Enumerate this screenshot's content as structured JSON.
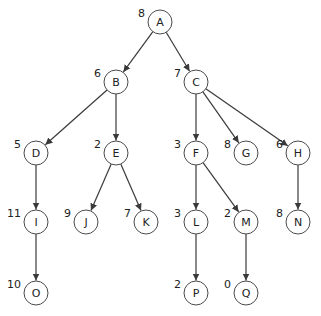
{
  "diagram": {
    "type": "tree",
    "node_radius": 12,
    "colors": {
      "line": "#3a3a3a",
      "node_stroke": "#4a4a4a",
      "text": "#222222",
      "background": "#ffffff"
    },
    "nodes": [
      {
        "id": "A",
        "label": "A",
        "value": "8",
        "x": 160,
        "y": 22
      },
      {
        "id": "B",
        "label": "B",
        "value": "6",
        "x": 116,
        "y": 82
      },
      {
        "id": "C",
        "label": "C",
        "value": "7",
        "x": 196,
        "y": 82
      },
      {
        "id": "D",
        "label": "D",
        "value": "5",
        "x": 36,
        "y": 153
      },
      {
        "id": "E",
        "label": "E",
        "value": "2",
        "x": 116,
        "y": 153
      },
      {
        "id": "F",
        "label": "F",
        "value": "3",
        "x": 196,
        "y": 153
      },
      {
        "id": "G",
        "label": "G",
        "value": "8",
        "x": 246,
        "y": 153
      },
      {
        "id": "H",
        "label": "H",
        "value": "6",
        "x": 298,
        "y": 153
      },
      {
        "id": "I",
        "label": "I",
        "value": "11",
        "x": 36,
        "y": 222
      },
      {
        "id": "J",
        "label": "J",
        "value": "9",
        "x": 86,
        "y": 222
      },
      {
        "id": "K",
        "label": "K",
        "value": "7",
        "x": 146,
        "y": 222
      },
      {
        "id": "L",
        "label": "L",
        "value": "3",
        "x": 196,
        "y": 222
      },
      {
        "id": "M",
        "label": "M",
        "value": "2",
        "x": 246,
        "y": 222
      },
      {
        "id": "N",
        "label": "N",
        "value": "8",
        "x": 298,
        "y": 222
      },
      {
        "id": "O",
        "label": "O",
        "value": "10",
        "x": 36,
        "y": 293
      },
      {
        "id": "P",
        "label": "P",
        "value": "2",
        "x": 196,
        "y": 293
      },
      {
        "id": "Q",
        "label": "Q",
        "value": "0",
        "x": 246,
        "y": 293
      }
    ],
    "edges": [
      [
        "A",
        "B"
      ],
      [
        "A",
        "C"
      ],
      [
        "B",
        "D"
      ],
      [
        "B",
        "E"
      ],
      [
        "C",
        "F"
      ],
      [
        "C",
        "G"
      ],
      [
        "C",
        "H"
      ],
      [
        "D",
        "I"
      ],
      [
        "E",
        "J"
      ],
      [
        "E",
        "K"
      ],
      [
        "F",
        "L"
      ],
      [
        "F",
        "M"
      ],
      [
        "H",
        "N"
      ],
      [
        "I",
        "O"
      ],
      [
        "L",
        "P"
      ],
      [
        "M",
        "Q"
      ]
    ]
  }
}
